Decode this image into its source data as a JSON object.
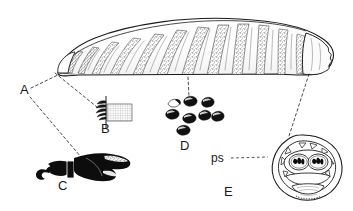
{
  "figure": {
    "background_color": "#ffffff",
    "ink_color": "#1a1a1a",
    "fill_light": "#fdfdfd",
    "stipple_color": "#6f6f6f",
    "solid_black": "#0d0d0d"
  },
  "panels": [
    {
      "id": "A",
      "label": "A",
      "name": "whole-larva-habitus",
      "label_x": 20,
      "label_y": 94
    },
    {
      "id": "B",
      "label": "B",
      "name": "anterior-spine-band-detail",
      "label_x": 101,
      "label_y": 133
    },
    {
      "id": "C",
      "label": "C",
      "name": "cephalopharyngeal-skeleton",
      "label_x": 58,
      "label_y": 190
    },
    {
      "id": "D",
      "label": "D",
      "name": "cuticular-spines-detail",
      "label_x": 180,
      "label_y": 150
    },
    {
      "id": "E",
      "label": "E",
      "name": "posterior-spiracular-plate",
      "label_x": 224,
      "label_y": 196
    }
  ],
  "annotations": [
    {
      "id": "ps",
      "label": "ps",
      "name": "posterior-spiracle-callout",
      "label_x": 213,
      "label_y": 162,
      "leader_from": [
        232,
        158
      ],
      "leader_to": [
        266,
        157
      ]
    }
  ],
  "leaders": [
    {
      "name": "leader-A-to-body-tip",
      "from": [
        30,
        90
      ],
      "to": [
        62,
        72
      ]
    },
    {
      "name": "leader-A-to-C",
      "from": [
        30,
        96
      ],
      "to": [
        80,
        158
      ]
    },
    {
      "name": "leader-body-to-B",
      "from": [
        56,
        72
      ],
      "to": [
        97,
        108
      ]
    },
    {
      "name": "leader-body-to-D",
      "from": [
        188,
        76
      ],
      "to": [
        189,
        98
      ]
    },
    {
      "name": "leader-body-to-E",
      "from": [
        308,
        73
      ],
      "to": [
        288,
        137
      ]
    }
  ],
  "larva": {
    "name": "larva-body",
    "segment_count": 12,
    "orientation": "anterior-left-posterior-right"
  },
  "spines_panel_D": {
    "count": 8,
    "positions": [
      [
        174,
        102
      ],
      [
        190,
        100
      ],
      [
        207,
        103
      ],
      [
        172,
        113
      ],
      [
        188,
        117
      ],
      [
        203,
        115
      ],
      [
        216,
        116
      ],
      [
        183,
        129
      ]
    ]
  },
  "spiracle_plate_E": {
    "disc_count": 2,
    "slits_per_disc": 3
  }
}
